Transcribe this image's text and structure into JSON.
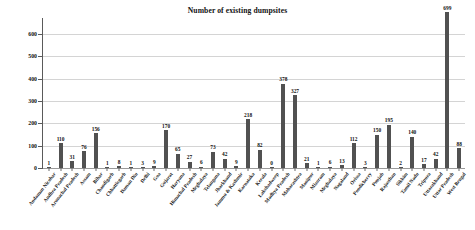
{
  "chart_data": {
    "type": "bar",
    "title": "Number of existing dumpsites",
    "xlabel": "",
    "ylabel": "",
    "ylim": [
      0,
      650
    ],
    "yticks": [
      0,
      100,
      200,
      300,
      400,
      500,
      600
    ],
    "ytick_labels": [
      "0",
      "100",
      "200",
      "300",
      "400",
      "500",
      "600"
    ],
    "grid": true,
    "legend": false,
    "bar_color": "#515151",
    "categories": [
      "Andaman Nicobar",
      "Andhra Pradesh",
      "Arunachal Pradesh",
      "Assam",
      "Bihar",
      "Chandigarh",
      "Chhattisgarh",
      "Daman Diu",
      "Delhi",
      "Goa",
      "Gujarat",
      "Haryana",
      "Himachal Pradesh",
      "Meghalaya",
      "Telangana",
      "Jharkhand",
      "Jammu & Kashmir",
      "Karnataka",
      "Kerala",
      "Lakshadweep",
      "Madhya Pradesh",
      "Maharashtra",
      "Manipur",
      "Mizoram",
      "Meghalaya",
      "Nagaland",
      "Orissa",
      "Pondicherry",
      "Punjab",
      "Rajasthan",
      "Sikkim",
      "Tamil Nadu",
      "Tripura",
      "Uttarakhand",
      "Uttar Pradesh",
      "West Bengal"
    ],
    "values": [
      1,
      110,
      31,
      76,
      156,
      1,
      8,
      1,
      3,
      9,
      170,
      65,
      27,
      6,
      73,
      42,
      9,
      218,
      82,
      0,
      378,
      327,
      21,
      1,
      6,
      13,
      112,
      3,
      150,
      195,
      2,
      140,
      17,
      42,
      699,
      88
    ],
    "value_labels": [
      "1",
      "110",
      "31",
      "76",
      "156",
      "1",
      "8",
      "1",
      "3",
      "9",
      "170",
      "65",
      "27",
      "6",
      "73",
      "42",
      "9",
      "218",
      "82",
      "0",
      "378",
      "327",
      "21",
      "1",
      "6",
      "13",
      "112",
      "3",
      "150",
      "195",
      "2",
      "140",
      "17",
      "42",
      "699",
      "88"
    ]
  }
}
